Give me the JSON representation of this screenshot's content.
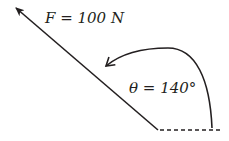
{
  "diagram": {
    "force_label": "F = 100 N",
    "angle_label": "θ = 140°",
    "force_magnitude": "100 N",
    "angle": "140°",
    "colors": {
      "stroke": "#231f20",
      "background": "#ffffff"
    }
  }
}
